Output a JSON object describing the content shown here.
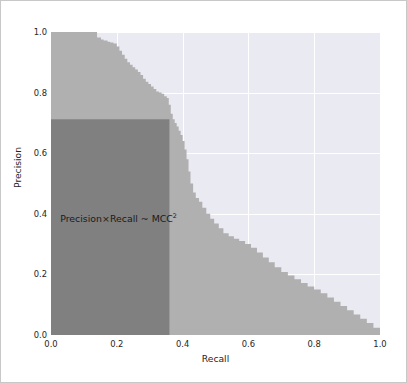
{
  "figure": {
    "width": 407,
    "height": 383,
    "background": "#ffffff",
    "border_color": "#c8c8c8"
  },
  "chart_data": {
    "type": "area",
    "title": "",
    "xlabel": "Recall",
    "ylabel": "Precision",
    "xlim": [
      0.0,
      1.0
    ],
    "ylim": [
      0.0,
      1.0
    ],
    "grid": true,
    "grid_color": "#ffffff",
    "axes_background": "#eaeaf2",
    "legend": null,
    "xticks": [
      "0.0",
      "0.2",
      "0.4",
      "0.6",
      "0.8",
      "1.0"
    ],
    "xtick_values": [
      0.0,
      0.2,
      0.4,
      0.6,
      0.8,
      1.0
    ],
    "yticks": [
      "0.0",
      "0.2",
      "0.4",
      "0.6",
      "0.8",
      "1.0"
    ],
    "ytick_values": [
      0.0,
      0.2,
      0.4,
      0.6,
      0.8,
      1.0
    ],
    "series": [
      {
        "name": "Precision-Recall curve (filled area)",
        "kind": "step-area",
        "fill_color": "#b0b0b0",
        "x": [
          0.0,
          0.13,
          0.14,
          0.152,
          0.16,
          0.172,
          0.18,
          0.19,
          0.2,
          0.208,
          0.216,
          0.224,
          0.232,
          0.24,
          0.248,
          0.256,
          0.264,
          0.272,
          0.28,
          0.288,
          0.296,
          0.304,
          0.312,
          0.32,
          0.328,
          0.336,
          0.344,
          0.352,
          0.358,
          0.364,
          0.37,
          0.376,
          0.382,
          0.388,
          0.394,
          0.4,
          0.406,
          0.412,
          0.418,
          0.424,
          0.432,
          0.44,
          0.45,
          0.46,
          0.472,
          0.484,
          0.496,
          0.51,
          0.524,
          0.54,
          0.556,
          0.572,
          0.59,
          0.608,
          0.626,
          0.644,
          0.662,
          0.68,
          0.7,
          0.72,
          0.74,
          0.76,
          0.78,
          0.8,
          0.82,
          0.84,
          0.86,
          0.88,
          0.9,
          0.92,
          0.94,
          0.96,
          0.98,
          1.0
        ],
        "y": [
          1.0,
          1.0,
          0.982,
          0.975,
          0.972,
          0.968,
          0.965,
          0.962,
          0.952,
          0.938,
          0.925,
          0.912,
          0.9,
          0.892,
          0.884,
          0.876,
          0.868,
          0.858,
          0.846,
          0.836,
          0.828,
          0.82,
          0.812,
          0.804,
          0.8,
          0.796,
          0.788,
          0.782,
          0.76,
          0.73,
          0.712,
          0.7,
          0.688,
          0.674,
          0.66,
          0.64,
          0.612,
          0.58,
          0.54,
          0.5,
          0.47,
          0.452,
          0.44,
          0.42,
          0.4,
          0.384,
          0.368,
          0.352,
          0.336,
          0.326,
          0.318,
          0.31,
          0.3,
          0.288,
          0.272,
          0.256,
          0.24,
          0.224,
          0.208,
          0.196,
          0.184,
          0.172,
          0.16,
          0.15,
          0.138,
          0.124,
          0.11,
          0.096,
          0.082,
          0.068,
          0.054,
          0.04,
          0.024,
          0.008
        ]
      },
      {
        "name": "Precision x Recall rectangle",
        "kind": "rect",
        "fill_color": "#808080",
        "x0": 0.0,
        "y0": 0.0,
        "x1": 0.36,
        "y1": 0.712
      }
    ],
    "annotations": [
      {
        "name": "mcc-annotation",
        "text_main": "Precision×Recall ~ MCC",
        "text_sup": "2",
        "x": 0.028,
        "y": 0.382,
        "color": "#1a1a1a"
      }
    ]
  }
}
